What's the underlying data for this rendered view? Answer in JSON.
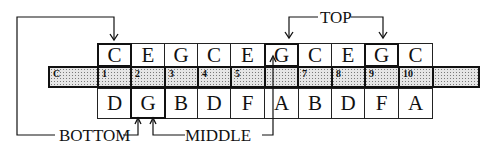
{
  "diagram": {
    "top_row": [
      {
        "note": "C",
        "bold": true
      },
      {
        "note": "E",
        "bold": false
      },
      {
        "note": "G",
        "bold": false
      },
      {
        "note": "C",
        "bold": false
      },
      {
        "note": "E",
        "bold": false
      },
      {
        "note": "G",
        "bold": true
      },
      {
        "note": "C",
        "bold": false
      },
      {
        "note": "E",
        "bold": false
      },
      {
        "note": "G",
        "bold": true
      },
      {
        "note": "C",
        "bold": false
      }
    ],
    "middle_strip": {
      "lead_label": "C",
      "numbers": [
        "1",
        "2",
        "3",
        "4",
        "5",
        "",
        "7",
        "8",
        "9",
        "10"
      ],
      "trailing_blank": ""
    },
    "bottom_row": [
      {
        "note": "D",
        "bold": false
      },
      {
        "note": "G",
        "bold": true
      },
      {
        "note": "B",
        "bold": false
      },
      {
        "note": "D",
        "bold": false
      },
      {
        "note": "F",
        "bold": false
      },
      {
        "note": "A",
        "bold": false
      },
      {
        "note": "B",
        "bold": false
      },
      {
        "note": "D",
        "bold": false
      },
      {
        "note": "F",
        "bold": false
      },
      {
        "note": "A",
        "bold": false
      }
    ],
    "labels": {
      "top": "TOP",
      "bottom": "BOTTOM",
      "middle": "MIDDLE"
    }
  }
}
